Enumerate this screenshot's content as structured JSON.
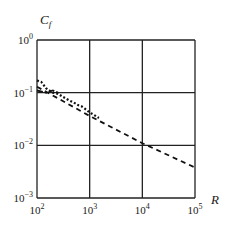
{
  "chart_data": {
    "type": "line",
    "title": "",
    "xlabel": "R",
    "ylabel": "C_f",
    "xscale": "log",
    "yscale": "log",
    "xlim": [
      100,
      100000
    ],
    "ylim": [
      0.001,
      1
    ],
    "grid": true,
    "x_ticks": [
      {
        "value": 100,
        "base": "10",
        "exp": "2"
      },
      {
        "value": 1000,
        "base": "10",
        "exp": "3"
      },
      {
        "value": 10000,
        "base": "10",
        "exp": "4"
      },
      {
        "value": 100000,
        "base": "10",
        "exp": "5"
      }
    ],
    "y_ticks": [
      {
        "value": 1,
        "base": "10",
        "exp": "0"
      },
      {
        "value": 0.1,
        "base": "10",
        "exp": "−1"
      },
      {
        "value": 0.01,
        "base": "10",
        "exp": "−2"
      },
      {
        "value": 0.001,
        "base": "10",
        "exp": "−3"
      }
    ],
    "series": [
      {
        "name": "power-law fit",
        "style": "dashed",
        "x": [
          100,
          1000,
          10000,
          100000
        ],
        "y": [
          0.13,
          0.036,
          0.011,
          0.0038
        ]
      },
      {
        "name": "data",
        "style": "dotted",
        "x": [
          100,
          120,
          150,
          200,
          250,
          300,
          400,
          500,
          600,
          700,
          800,
          1000,
          1200,
          1500
        ],
        "y": [
          0.17,
          0.16,
          0.12,
          0.1,
          0.095,
          0.085,
          0.072,
          0.065,
          0.058,
          0.055,
          0.05,
          0.042,
          0.038,
          0.033
        ]
      },
      {
        "name": "data-2",
        "style": "dash-dot",
        "x": [
          100,
          150,
          200,
          250
        ],
        "y": [
          0.11,
          0.1,
          0.11,
          0.1
        ]
      }
    ]
  },
  "labels": {
    "y_axis": "C",
    "y_axis_sub": "f",
    "x_axis": "R"
  }
}
